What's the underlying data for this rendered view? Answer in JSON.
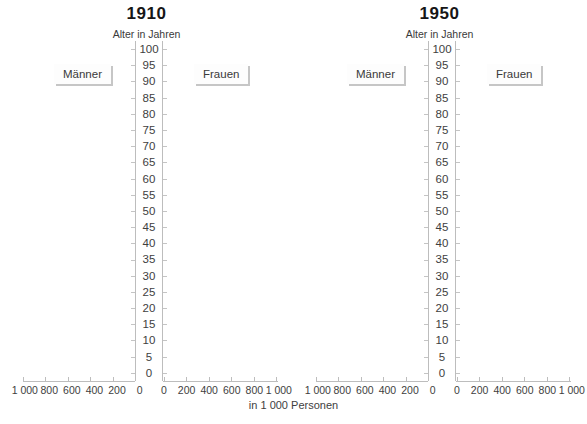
{
  "panels": [
    {
      "year": "1910",
      "men_label": "Männer",
      "women_label": "Frauen"
    },
    {
      "year": "1950",
      "men_label": "Männer",
      "women_label": "Frauen"
    }
  ],
  "age_axis": {
    "title": "Alter in Jahren",
    "labels": [
      "100",
      "95",
      "90",
      "85",
      "80",
      "75",
      "70",
      "65",
      "60",
      "55",
      "50",
      "45",
      "40",
      "35",
      "30",
      "25",
      "20",
      "15",
      "10",
      "5",
      "0"
    ]
  },
  "bottom_axis": {
    "left_labels": [
      "1 000",
      "800",
      "600",
      "400",
      "200",
      "0"
    ],
    "right_labels": [
      "0",
      "200",
      "400",
      "600",
      "800",
      "1 000"
    ],
    "unit_label": "in 1 000 Personen"
  },
  "colors": {
    "axis_line": "#bdbdbd",
    "tick": "#c4c4c4",
    "text": "#3e3e3e",
    "title": "#161616",
    "label_shadow": "#c6c6c6",
    "background": "#ffffff"
  },
  "chart_data": [
    {
      "type": "bar",
      "subtype": "population-pyramid",
      "title": "1910",
      "ylabel": "Alter in Jahren",
      "xlabel": "in 1 000 Personen",
      "age_ticks": [
        0,
        5,
        10,
        15,
        20,
        25,
        30,
        35,
        40,
        45,
        50,
        55,
        60,
        65,
        70,
        75,
        80,
        85,
        90,
        95,
        100
      ],
      "x_ticks_left_to_center": [
        1000,
        800,
        600,
        400,
        200,
        0
      ],
      "x_ticks_center_to_right": [
        0,
        200,
        400,
        600,
        800,
        1000
      ],
      "ylim": [
        0,
        100
      ],
      "xlim_per_side": [
        0,
        1000
      ],
      "grid": false,
      "series": [
        {
          "name": "Männer",
          "side": "left",
          "values": []
        },
        {
          "name": "Frauen",
          "side": "right",
          "values": []
        }
      ]
    },
    {
      "type": "bar",
      "subtype": "population-pyramid",
      "title": "1950",
      "ylabel": "Alter in Jahren",
      "xlabel": "in 1 000 Personen",
      "age_ticks": [
        0,
        5,
        10,
        15,
        20,
        25,
        30,
        35,
        40,
        45,
        50,
        55,
        60,
        65,
        70,
        75,
        80,
        85,
        90,
        95,
        100
      ],
      "x_ticks_left_to_center": [
        1000,
        800,
        600,
        400,
        200,
        0
      ],
      "x_ticks_center_to_right": [
        0,
        200,
        400,
        600,
        800,
        1000
      ],
      "ylim": [
        0,
        100
      ],
      "xlim_per_side": [
        0,
        1000
      ],
      "grid": false,
      "series": [
        {
          "name": "Männer",
          "side": "left",
          "values": []
        },
        {
          "name": "Frauen",
          "side": "right",
          "values": []
        }
      ]
    }
  ]
}
